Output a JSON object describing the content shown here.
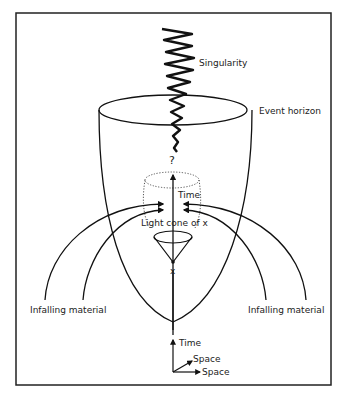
{
  "diagram": {
    "labels": {
      "singularity": "Singularity",
      "event_horizon": "Event horizon",
      "question": "?",
      "time_inner": "Time",
      "light_cone": "Light cone of x",
      "point_x": "x",
      "infalling_left": "Infalling material",
      "infalling_right": "Infalling material",
      "axis_time": "Time",
      "axis_space_1": "Space",
      "axis_space_2": "Space"
    }
  }
}
